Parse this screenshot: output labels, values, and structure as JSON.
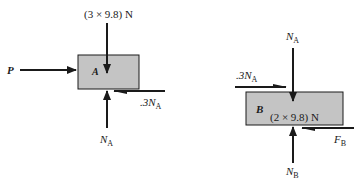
{
  "diagram": {
    "colors": {
      "block_fill": "#c4c4c4",
      "stroke": "#1a1a1a",
      "background": "#ffffff"
    },
    "block_a": {
      "label": "A",
      "forces": {
        "applied": {
          "symbol": "P"
        },
        "weight": {
          "text": "(3 × 9.8) N"
        },
        "normal": {
          "symbol": "N",
          "subscript": "A"
        },
        "friction": {
          "prefix": ".3N",
          "subscript": "A"
        }
      }
    },
    "block_b": {
      "label": "B",
      "forces": {
        "normal_from_a": {
          "symbol": "N",
          "subscript": "A"
        },
        "friction_from_a": {
          "prefix": ".3N",
          "subscript": "A"
        },
        "weight": {
          "text": "(2 × 9.8) N"
        },
        "friction_ground": {
          "symbol": "F",
          "subscript": "B"
        },
        "normal_ground": {
          "symbol": "N",
          "subscript": "B"
        }
      }
    }
  }
}
